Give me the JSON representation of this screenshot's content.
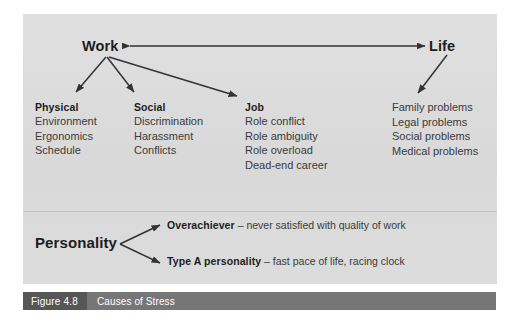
{
  "figure": {
    "number": "Figure 4.8",
    "title": "Causes of Stress"
  },
  "nodes": {
    "work": "Work",
    "life": "Life",
    "personality": "Personality"
  },
  "columns": [
    {
      "id": "physical",
      "heading": "Physical",
      "items": [
        "Environment",
        "Ergonomics",
        "Schedule"
      ]
    },
    {
      "id": "social",
      "heading": "Social",
      "items": [
        "Discrimination",
        "Harassment",
        "Conflicts"
      ]
    },
    {
      "id": "job",
      "heading": "Job",
      "items": [
        "Role conflict",
        "Role ambiguity",
        "Role overload",
        "Dead-end career"
      ]
    },
    {
      "id": "life",
      "heading": "",
      "items": [
        "Family problems",
        "Legal problems",
        "Social problems",
        "Medical problems"
      ]
    }
  ],
  "traits": [
    {
      "name": "Overachiever",
      "description": " – never satisfied with quality of work"
    },
    {
      "name": "Type A personality",
      "description": " – fast pace of life, racing clock"
    }
  ],
  "colors": {
    "panel_background": "#dcdcdc",
    "page_background": "#ffffff",
    "caption_bar": "#767676",
    "caption_number_block": "#565656",
    "arrow": "#333333",
    "text": "#2b2b2b"
  },
  "arrows": {
    "work_life": "double-headed-horizontal",
    "work_branches": 3,
    "life_branch": 1,
    "personality_branches": 2
  }
}
